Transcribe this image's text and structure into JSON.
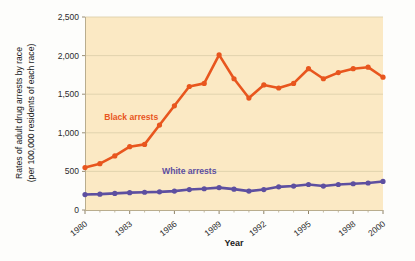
{
  "chart_data": {
    "type": "line",
    "title": "",
    "xlabel": "Year",
    "ylabel": "Rates of adult drug arrests by race (per 100,000 residents of each race)",
    "ylabel_line1": "Rates of adult drug arrests by race",
    "ylabel_line2": "(per 100,000 residents of each race)",
    "xlim": [
      1980,
      2000
    ],
    "ylim": [
      0,
      2500
    ],
    "ytick_values": [
      0,
      500,
      1000,
      1500,
      2000,
      2500
    ],
    "ytick_labels": [
      "0",
      "500",
      "1,000",
      "1,500",
      "2,000",
      "2,500"
    ],
    "xtick_values": [
      1980,
      1983,
      1986,
      1989,
      1992,
      1995,
      1998,
      2000
    ],
    "xtick_labels": [
      "1980",
      "1983",
      "1986",
      "1989",
      "1992",
      "1995",
      "1998",
      "2000"
    ],
    "xminor_values": [
      1981,
      1982,
      1984,
      1985,
      1987,
      1988,
      1990,
      1991,
      1993,
      1994,
      1996,
      1997,
      1999
    ],
    "grid": "horizontal",
    "plot_background": "#fbe9c4",
    "x": [
      1980,
      1981,
      1982,
      1983,
      1984,
      1985,
      1986,
      1987,
      1988,
      1989,
      1990,
      1991,
      1992,
      1993,
      1994,
      1995,
      1996,
      1997,
      1998,
      1999,
      2000
    ],
    "series": [
      {
        "name": "Black arrests",
        "color": "#e8561e",
        "label_x": 1983.1,
        "label_y": 1160,
        "values": [
          550,
          600,
          700,
          820,
          850,
          1100,
          1350,
          1600,
          1640,
          2010,
          1700,
          1450,
          1620,
          1580,
          1640,
          1830,
          1700,
          1780,
          1830,
          1850,
          1720
        ]
      },
      {
        "name": "White arrests",
        "color": "#5d4fa0",
        "label_x": 1987.0,
        "label_y": 460,
        "values": [
          200,
          205,
          215,
          225,
          230,
          235,
          245,
          265,
          275,
          290,
          270,
          245,
          265,
          300,
          310,
          330,
          310,
          330,
          340,
          350,
          370
        ]
      }
    ]
  }
}
